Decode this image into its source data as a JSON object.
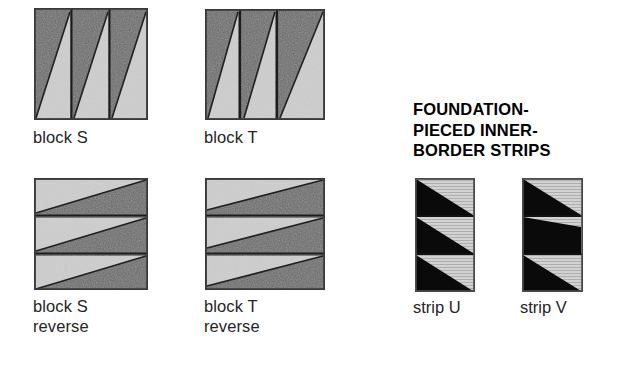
{
  "figure": {
    "background_color": "#ffffff",
    "heading": {
      "text": "FOUNDATION-\nPIECED INNER-\nBORDER STRIPS",
      "color": "#000000"
    },
    "palette": {
      "dark_fabric": "#6d6d6d",
      "dark_fabric_speckle": "#545454",
      "light_fabric": "#cccccc",
      "light_fabric_edge": "#b8b8b8",
      "black_fabric": "#0b0b0b",
      "hatched_light": "#c9c9c9",
      "hatch_line": "#b0b0b0",
      "outline": "#2b2b2b"
    },
    "blocks": [
      {
        "id": "block-s",
        "caption": "block S",
        "orientation": "vertical-panels",
        "panels": 3,
        "panel_light_ratio": [
          0.62,
          0.62,
          0.62
        ],
        "x": 34,
        "y": 8,
        "width": 114,
        "height": 112
      },
      {
        "id": "block-t",
        "caption": "block T",
        "orientation": "vertical-panels",
        "panels": 3,
        "panel_light_ratio": [
          0.55,
          0.55,
          0.95
        ],
        "x": 205,
        "y": 9,
        "width": 120,
        "height": 111
      },
      {
        "id": "block-s-reverse",
        "caption": "block S\nreverse",
        "orientation": "horizontal-strips",
        "panels": 3,
        "panel_light_ratio": [
          0.62,
          0.62,
          0.62
        ],
        "x": 34,
        "y": 178,
        "width": 114,
        "height": 112
      },
      {
        "id": "block-t-reverse",
        "caption": "block T\nreverse",
        "orientation": "horizontal-strips",
        "panels": 3,
        "panel_light_ratio": [
          0.88,
          0.88,
          0.88
        ],
        "x": 205,
        "y": 178,
        "width": 120,
        "height": 112
      }
    ],
    "strips": [
      {
        "id": "strip-u",
        "caption": "strip U",
        "cells": 3,
        "cell_flipped": [
          false,
          false,
          false
        ],
        "x": 415,
        "y": 178,
        "width": 60,
        "height": 114
      },
      {
        "id": "strip-v",
        "caption": "strip V",
        "cells": 3,
        "cell_flipped": [
          false,
          true,
          false
        ],
        "x": 522,
        "y": 178,
        "width": 61,
        "height": 114
      }
    ],
    "captions": [
      {
        "id": "caption-block-s",
        "text": "block S",
        "x": 33,
        "y": 128
      },
      {
        "id": "caption-block-t",
        "text": "block T",
        "x": 204,
        "y": 128
      },
      {
        "id": "caption-block-s-reverse",
        "text": "block S\nreverse",
        "x": 33,
        "y": 298
      },
      {
        "id": "caption-block-t-reverse",
        "text": "block T\nreverse",
        "x": 204,
        "y": 298
      },
      {
        "id": "caption-strip-u",
        "text": "strip U",
        "x": 413,
        "y": 298
      },
      {
        "id": "caption-strip-v",
        "text": "strip V",
        "x": 520,
        "y": 298
      }
    ]
  }
}
